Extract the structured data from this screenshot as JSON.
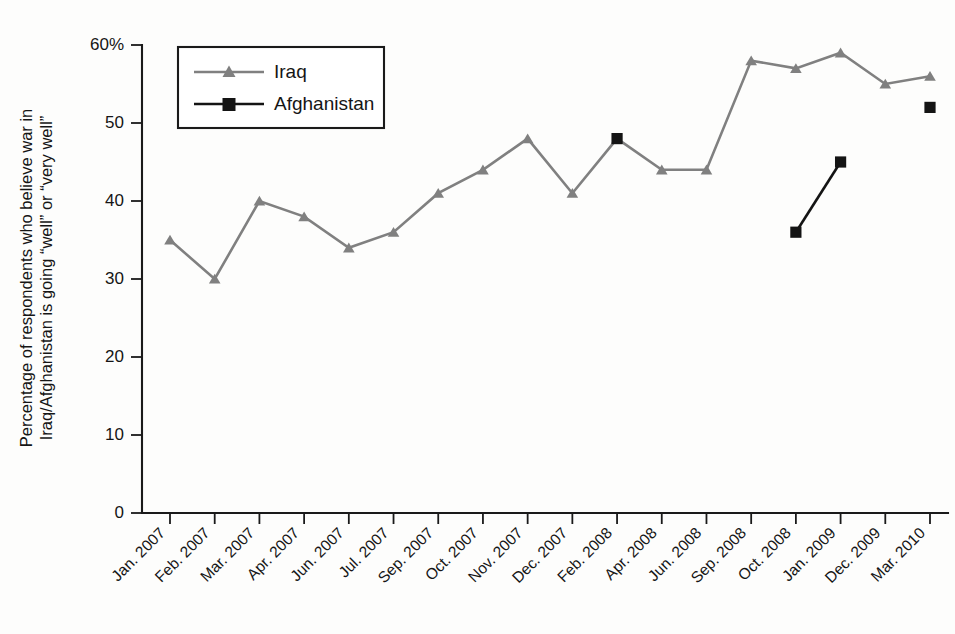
{
  "chart_data": {
    "type": "line",
    "title": "",
    "xlabel": "",
    "ylabel": "Percentage of respondents who believe war in Iraq/Afghanistan is going “well” or “very well”",
    "ylabel_line1": "Percentage of respondents who believe war in",
    "ylabel_line2": "Iraq/Afghanistan is going “well” or “very well”",
    "categories": [
      "Jan. 2007",
      "Feb. 2007",
      "Mar. 2007",
      "Apr. 2007",
      "Jun. 2007",
      "Jul. 2007",
      "Sep. 2007",
      "Oct. 2007",
      "Nov. 2007",
      "Dec. 2007",
      "Feb. 2008",
      "Apr. 2008",
      "Jun. 2008",
      "Sep. 2008",
      "Oct. 2008",
      "Jan. 2009",
      "Dec. 2009",
      "Mar. 2010"
    ],
    "ylim": [
      0,
      60
    ],
    "yticks": [
      0,
      10,
      20,
      30,
      40,
      50,
      60
    ],
    "ytick_labels": [
      "0",
      "10",
      "20",
      "30",
      "40",
      "50",
      "60%"
    ],
    "grid": false,
    "legend_position": "top-left",
    "series": [
      {
        "name": "Iraq",
        "color": "#808080",
        "marker": "triangle",
        "values": [
          35,
          30,
          40,
          38,
          34,
          36,
          41,
          44,
          48,
          41,
          48,
          44,
          44,
          58,
          57,
          59,
          55,
          56
        ]
      },
      {
        "name": "Afghanistan",
        "color": "#141414",
        "marker": "square",
        "values": [
          null,
          null,
          null,
          null,
          null,
          null,
          null,
          null,
          null,
          null,
          48,
          null,
          null,
          null,
          36,
          45,
          null,
          52
        ]
      }
    ]
  },
  "legend": {
    "entries": [
      {
        "label": "Iraq"
      },
      {
        "label": "Afghanistan"
      }
    ]
  },
  "colors": {
    "iraq": "#808080",
    "afghanistan": "#141414",
    "axis": "#1a1a1a",
    "background": "#fdfdfc"
  }
}
